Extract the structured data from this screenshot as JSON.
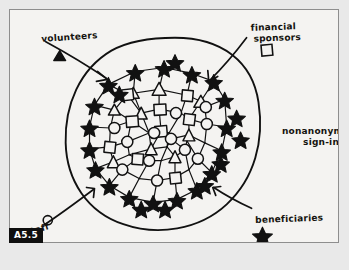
{
  "figure": {
    "tag": "A5.5",
    "container_label": {
      "line1": "nonanonymous",
      "line2": "sign-ins"
    },
    "legend": [
      {
        "id": "volunteers",
        "label": "volunteers",
        "glyph": "triangle-glyph",
        "glyph_char": "△",
        "arrow": "arrow-volunteers"
      },
      {
        "id": "financial-sponsors",
        "label_line1": "financial",
        "label_line2": "sponsors",
        "glyph": "square-glyph",
        "glyph_char": "□",
        "arrow": "arrow-financial-sponsors"
      },
      {
        "id": "beneficiaries",
        "label": "beneficiaries",
        "glyph": "star-glyph",
        "glyph_char": "☆",
        "arrow": "arrow-beneficiaries"
      },
      {
        "id": "staff",
        "label": "staff",
        "glyph": "circle-glyph",
        "glyph_char": "○",
        "arrow": "arrow-staff"
      }
    ],
    "colors": {
      "ink": "#111111",
      "paper": "#f4f3f1",
      "page": "#e9e9e9",
      "border": "#8e8e8e",
      "tag_bg": "#0f0f0f",
      "tag_fg": "#ffffff"
    },
    "network": {
      "description": "hand-drawn node-link network inside a blob boundary",
      "node_types": [
        "star",
        "circle",
        "square",
        "triangle"
      ],
      "star_count": 26,
      "inner_count": 24
    }
  }
}
